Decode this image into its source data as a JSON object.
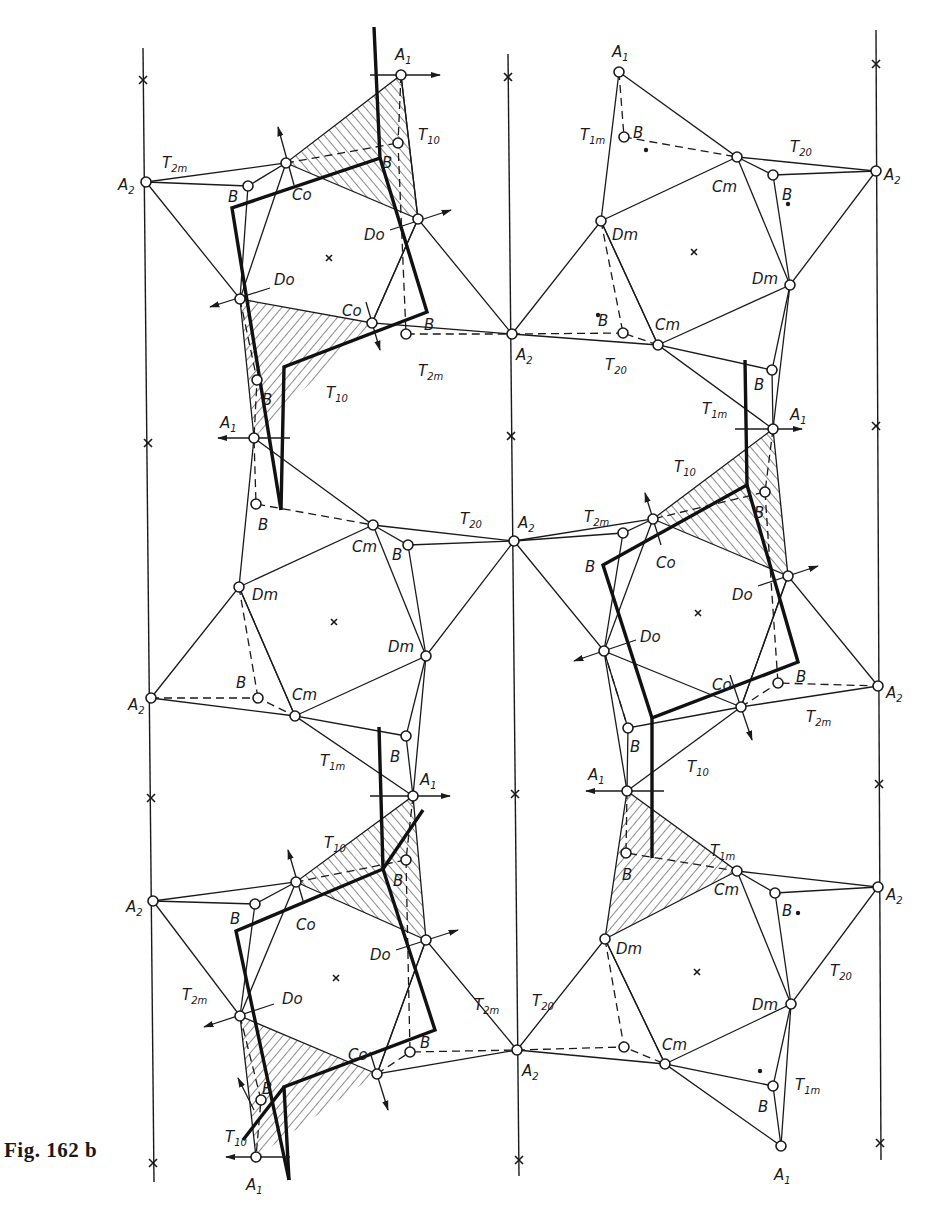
{
  "figure": {
    "caption": "Fig. 162 b",
    "type": "crystal structure projection"
  },
  "diagram": {
    "mirror_axes_x": [
      148,
      512,
      877
    ],
    "axis_marks": [
      {
        "x": 143,
        "y": 80
      },
      {
        "x": 148,
        "y": 443
      },
      {
        "x": 151,
        "y": 798
      },
      {
        "x": 153,
        "y": 1163
      },
      {
        "x": 508,
        "y": 77
      },
      {
        "x": 511,
        "y": 436
      },
      {
        "x": 515,
        "y": 794
      },
      {
        "x": 519,
        "y": 1160
      },
      {
        "x": 876,
        "y": 64
      },
      {
        "x": 876,
        "y": 426
      },
      {
        "x": 879,
        "y": 784
      },
      {
        "x": 880,
        "y": 1143
      }
    ],
    "ring_centers": [
      {
        "x": 329,
        "y": 258
      },
      {
        "x": 694,
        "y": 252
      },
      {
        "x": 334,
        "y": 622
      },
      {
        "x": 698,
        "y": 613
      },
      {
        "x": 336,
        "y": 978
      },
      {
        "x": 697,
        "y": 972
      }
    ],
    "nodes": [
      {
        "id": "A2_1",
        "x": 146,
        "y": 182,
        "label": "A",
        "sub": "2",
        "lx": 118,
        "ly": 190
      },
      {
        "id": "A1_1",
        "x": 401,
        "y": 75,
        "label": "A",
        "sub": "1",
        "lx": 395,
        "ly": 60
      },
      {
        "id": "Co_1",
        "x": 286,
        "y": 163,
        "label": "Co",
        "sub": "",
        "lx": 292,
        "ly": 200
      },
      {
        "id": "B_1",
        "x": 248,
        "y": 186,
        "label": "B",
        "sub": "",
        "lx": 228,
        "ly": 202
      },
      {
        "id": "B_2",
        "x": 398,
        "y": 143,
        "label": "B",
        "sub": "",
        "lx": 382,
        "ly": 168
      },
      {
        "id": "Do_1",
        "x": 418,
        "y": 219,
        "label": "Do",
        "sub": "",
        "lx": 364,
        "ly": 240
      },
      {
        "id": "Do_2",
        "x": 240,
        "y": 299,
        "label": "Do",
        "sub": "",
        "lx": 274,
        "ly": 285
      },
      {
        "id": "Co_2",
        "x": 372,
        "y": 323,
        "label": "Co",
        "sub": "",
        "lx": 342,
        "ly": 316
      },
      {
        "id": "B_3",
        "x": 406,
        "y": 334,
        "label": "B",
        "sub": "",
        "lx": 424,
        "ly": 330
      },
      {
        "id": "B_4",
        "x": 257,
        "y": 380,
        "label": "B",
        "sub": "",
        "lx": 262,
        "ly": 405
      },
      {
        "id": "A1_2",
        "x": 254,
        "y": 438,
        "label": "A",
        "sub": "1",
        "lx": 220,
        "ly": 428
      },
      {
        "id": "A2_2",
        "x": 512,
        "y": 334,
        "label": "A",
        "sub": "2",
        "lx": 516,
        "ly": 360
      },
      {
        "id": "A1_3",
        "x": 619,
        "y": 72,
        "label": "A",
        "sub": "1",
        "lx": 612,
        "ly": 57
      },
      {
        "id": "B_5",
        "x": 624,
        "y": 137,
        "label": "B",
        "sub": "",
        "lx": 633,
        "ly": 138
      },
      {
        "id": "Cm_1",
        "x": 737,
        "y": 157,
        "label": "Cm",
        "sub": "",
        "lx": 712,
        "ly": 192
      },
      {
        "id": "B_6",
        "x": 773,
        "y": 175,
        "label": "B",
        "sub": "",
        "lx": 782,
        "ly": 200
      },
      {
        "id": "A2_3",
        "x": 876,
        "y": 171,
        "label": "A",
        "sub": "2",
        "lx": 884,
        "ly": 180
      },
      {
        "id": "Dm_1",
        "x": 601,
        "y": 221,
        "label": "Dm",
        "sub": "",
        "lx": 612,
        "ly": 240
      },
      {
        "id": "Dm_2",
        "x": 790,
        "y": 285,
        "label": "Dm",
        "sub": "",
        "lx": 752,
        "ly": 284
      },
      {
        "id": "B_7",
        "x": 623,
        "y": 333,
        "label": "B",
        "sub": "",
        "lx": 598,
        "ly": 326
      },
      {
        "id": "Cm_2",
        "x": 658,
        "y": 345,
        "label": "Cm",
        "sub": "",
        "lx": 655,
        "ly": 330
      },
      {
        "id": "B_8",
        "x": 772,
        "y": 370,
        "label": "B",
        "sub": "",
        "lx": 754,
        "ly": 390
      },
      {
        "id": "A1_4",
        "x": 773,
        "y": 429,
        "label": "A",
        "sub": "1",
        "lx": 790,
        "ly": 420
      },
      {
        "id": "B_9",
        "x": 765,
        "y": 492,
        "label": "B",
        "sub": "",
        "lx": 754,
        "ly": 518
      },
      {
        "id": "Co_3",
        "x": 653,
        "y": 519,
        "label": "Co",
        "sub": "",
        "lx": 656,
        "ly": 568
      },
      {
        "id": "A2_4",
        "x": 514,
        "y": 541,
        "label": "A",
        "sub": "2",
        "lx": 518,
        "ly": 528
      },
      {
        "id": "B_10",
        "x": 623,
        "y": 533,
        "label": "B",
        "sub": "",
        "lx": 585,
        "ly": 572
      },
      {
        "id": "Do_3",
        "x": 788,
        "y": 576,
        "label": "Do",
        "sub": "",
        "lx": 732,
        "ly": 600
      },
      {
        "id": "Do_4",
        "x": 604,
        "y": 651,
        "label": "Do",
        "sub": "",
        "lx": 640,
        "ly": 642
      },
      {
        "id": "B_11",
        "x": 778,
        "y": 683,
        "label": "B",
        "sub": "",
        "lx": 796,
        "ly": 682
      },
      {
        "id": "A2_5",
        "x": 878,
        "y": 686,
        "label": "A",
        "sub": "2",
        "lx": 886,
        "ly": 698
      },
      {
        "id": "Co_4",
        "x": 741,
        "y": 707,
        "label": "Co",
        "sub": "",
        "lx": 712,
        "ly": 690
      },
      {
        "id": "B_12",
        "x": 628,
        "y": 728,
        "label": "B",
        "sub": "",
        "lx": 630,
        "ly": 752
      },
      {
        "id": "A1_5",
        "x": 627,
        "y": 791,
        "label": "A",
        "sub": "1",
        "lx": 588,
        "ly": 780
      },
      {
        "id": "B_13",
        "x": 408,
        "y": 545,
        "label": "B",
        "sub": "",
        "lx": 392,
        "ly": 560
      },
      {
        "id": "Cm_3",
        "x": 373,
        "y": 525,
        "label": "Cm",
        "sub": "",
        "lx": 352,
        "ly": 552
      },
      {
        "id": "B_14",
        "x": 256,
        "y": 504,
        "label": "B",
        "sub": "",
        "lx": 258,
        "ly": 530
      },
      {
        "id": "Dm_3",
        "x": 239,
        "y": 587,
        "label": "Dm",
        "sub": "",
        "lx": 252,
        "ly": 600
      },
      {
        "id": "Dm_4",
        "x": 426,
        "y": 656,
        "label": "Dm",
        "sub": "",
        "lx": 388,
        "ly": 652
      },
      {
        "id": "A2_6",
        "x": 151,
        "y": 698,
        "label": "A",
        "sub": "2",
        "lx": 128,
        "ly": 710
      },
      {
        "id": "B_15",
        "x": 258,
        "y": 698,
        "label": "B",
        "sub": "",
        "lx": 236,
        "ly": 688
      },
      {
        "id": "Cm_4",
        "x": 295,
        "y": 716,
        "label": "Cm",
        "sub": "",
        "lx": 292,
        "ly": 700
      },
      {
        "id": "B_16",
        "x": 406,
        "y": 736,
        "label": "B",
        "sub": "",
        "lx": 390,
        "ly": 762
      },
      {
        "id": "A1_6",
        "x": 413,
        "y": 796,
        "label": "A",
        "sub": "1",
        "lx": 420,
        "ly": 785
      },
      {
        "id": "B_17",
        "x": 406,
        "y": 860,
        "label": "B",
        "sub": "",
        "lx": 393,
        "ly": 886
      },
      {
        "id": "Co_5",
        "x": 296,
        "y": 882,
        "label": "Co",
        "sub": "",
        "lx": 296,
        "ly": 930
      },
      {
        "id": "A2_7",
        "x": 153,
        "y": 901,
        "label": "A",
        "sub": "2",
        "lx": 126,
        "ly": 912
      },
      {
        "id": "B_18",
        "x": 255,
        "y": 904,
        "label": "B",
        "sub": "",
        "lx": 230,
        "ly": 924
      },
      {
        "id": "Do_5",
        "x": 426,
        "y": 940,
        "label": "Do",
        "sub": "",
        "lx": 370,
        "ly": 960
      },
      {
        "id": "Do_6",
        "x": 240,
        "y": 1016,
        "label": "Do",
        "sub": "",
        "lx": 282,
        "ly": 1004
      },
      {
        "id": "B_19",
        "x": 410,
        "y": 1052,
        "label": "B",
        "sub": "",
        "lx": 420,
        "ly": 1048
      },
      {
        "id": "Co_6",
        "x": 377,
        "y": 1074,
        "label": "Co",
        "sub": "",
        "lx": 348,
        "ly": 1060
      },
      {
        "id": "B_20",
        "x": 261,
        "y": 1100,
        "label": "B",
        "sub": "",
        "lx": 262,
        "ly": 1094
      },
      {
        "id": "A1_7",
        "x": 256,
        "y": 1157,
        "label": "A",
        "sub": "1",
        "lx": 246,
        "ly": 1190
      },
      {
        "id": "A2_8",
        "x": 517,
        "y": 1050,
        "label": "A",
        "sub": "2",
        "lx": 522,
        "ly": 1076
      },
      {
        "id": "B_21",
        "x": 626,
        "y": 853,
        "label": "B",
        "sub": "",
        "lx": 622,
        "ly": 880
      },
      {
        "id": "Cm_5",
        "x": 737,
        "y": 871,
        "label": "Cm",
        "sub": "",
        "lx": 714,
        "ly": 895
      },
      {
        "id": "B_22",
        "x": 775,
        "y": 893,
        "label": "B",
        "sub": "",
        "lx": 782,
        "ly": 916
      },
      {
        "id": "A2_9",
        "x": 878,
        "y": 887,
        "label": "A",
        "sub": "2",
        "lx": 886,
        "ly": 900
      },
      {
        "id": "Dm_5",
        "x": 605,
        "y": 939,
        "label": "Dm",
        "sub": "",
        "lx": 616,
        "ly": 954
      },
      {
        "id": "Dm_6",
        "x": 791,
        "y": 1004,
        "label": "Dm",
        "sub": "",
        "lx": 752,
        "ly": 1010
      },
      {
        "id": "B_23",
        "x": 624,
        "y": 1047,
        "label": "B",
        "sub": "",
        "lx": 0,
        "ly": 0
      },
      {
        "id": "Cm_6",
        "x": 665,
        "y": 1064,
        "label": "Cm",
        "sub": "",
        "lx": 662,
        "ly": 1050
      },
      {
        "id": "B_24",
        "x": 773,
        "y": 1086,
        "label": "B",
        "sub": "",
        "lx": 758,
        "ly": 1112
      },
      {
        "id": "A1_8",
        "x": 781,
        "y": 1146,
        "label": "A",
        "sub": "1",
        "lx": 774,
        "ly": 1180
      }
    ],
    "t_labels": [
      {
        "text": "T",
        "sub": "2m",
        "x": 162,
        "y": 168
      },
      {
        "text": "T",
        "sub": "10",
        "x": 418,
        "y": 140
      },
      {
        "text": "T",
        "sub": "2m",
        "x": 418,
        "y": 376
      },
      {
        "text": "T",
        "sub": "10",
        "x": 326,
        "y": 398
      },
      {
        "text": "T",
        "sub": "1m",
        "x": 580,
        "y": 140
      },
      {
        "text": "T",
        "sub": "20",
        "x": 790,
        "y": 152
      },
      {
        "text": "T",
        "sub": "20",
        "x": 605,
        "y": 370
      },
      {
        "text": "T",
        "sub": "1m",
        "x": 702,
        "y": 414
      },
      {
        "text": "T",
        "sub": "10",
        "x": 674,
        "y": 472
      },
      {
        "text": "T",
        "sub": "20",
        "x": 460,
        "y": 524
      },
      {
        "text": "T",
        "sub": "2m",
        "x": 584,
        "y": 522
      },
      {
        "text": "T",
        "sub": "2m",
        "x": 806,
        "y": 722
      },
      {
        "text": "T",
        "sub": "10",
        "x": 687,
        "y": 772
      },
      {
        "text": "T",
        "sub": "1m",
        "x": 320,
        "y": 766
      },
      {
        "text": "T",
        "sub": "10",
        "x": 324,
        "y": 848
      },
      {
        "text": "T",
        "sub": "1m",
        "x": 710,
        "y": 856
      },
      {
        "text": "T",
        "sub": "2m",
        "x": 182,
        "y": 1000
      },
      {
        "text": "T",
        "sub": "2m",
        "x": 474,
        "y": 1010
      },
      {
        "text": "T",
        "sub": "20",
        "x": 532,
        "y": 1006
      },
      {
        "text": "T",
        "sub": "20",
        "x": 830,
        "y": 976
      },
      {
        "text": "T",
        "sub": "10",
        "x": 225,
        "y": 1142
      },
      {
        "text": "T",
        "sub": "1m",
        "x": 795,
        "y": 1090
      }
    ]
  }
}
